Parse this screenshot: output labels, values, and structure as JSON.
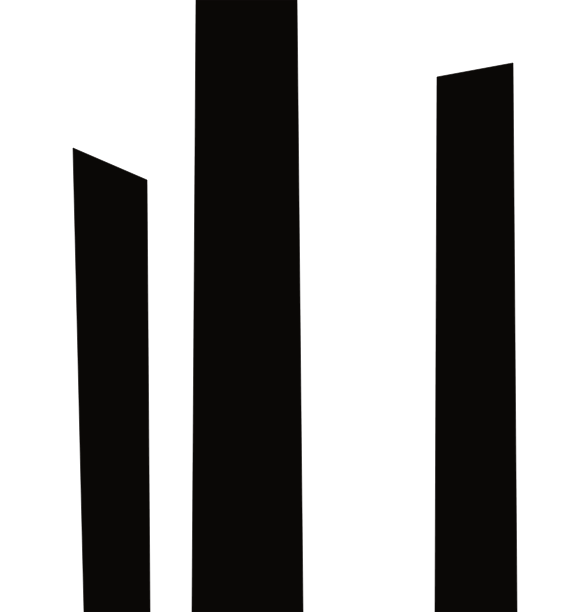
{
  "chart_data": {
    "type": "bar",
    "title": "",
    "subtitle": "",
    "xlabel": "",
    "ylabel": "",
    "categories": [
      "1",
      "2",
      "3"
    ],
    "values": [
      464,
      612,
      536
    ],
    "series": [
      {
        "name": "silhouette",
        "values": [
          464,
          612,
          536
        ]
      }
    ],
    "ylim": [
      0,
      612
    ],
    "grid": false,
    "legend": false,
    "legend_position": "none",
    "tick_labels_x": [],
    "tick_labels_y": [],
    "annotations": [],
    "bars": [
      {
        "name": "bar-1",
        "label": "",
        "value": 464,
        "top_left": [
          73,
          148
        ],
        "top_right": [
          147,
          180
        ],
        "bottom_right": [
          150,
          612
        ],
        "bottom_left": [
          84,
          612
        ],
        "top_edge": "slanted-down-right",
        "clipped_top": false
      },
      {
        "name": "bar-2",
        "label": "",
        "value": 612,
        "top_left": [
          196,
          0
        ],
        "top_right": [
          297,
          0
        ],
        "bottom_right": [
          303,
          612
        ],
        "bottom_left": [
          192,
          612
        ],
        "top_edge": "flat",
        "clipped_top": true
      },
      {
        "name": "bar-3",
        "label": "",
        "value": 536,
        "top_left": [
          437,
          77
        ],
        "top_right": [
          513,
          63
        ],
        "bottom_right": [
          517,
          612
        ],
        "bottom_left": [
          435,
          612
        ],
        "top_edge": "slanted-up-right",
        "clipped_top": false
      }
    ]
  },
  "canvas": {
    "width": 563,
    "height": 612,
    "background_color": "#ffffff",
    "bar_color": "#0a0806",
    "edge_color": "#151210"
  },
  "accessibility": {
    "alt_text": "Three tall black bars on a white background"
  }
}
